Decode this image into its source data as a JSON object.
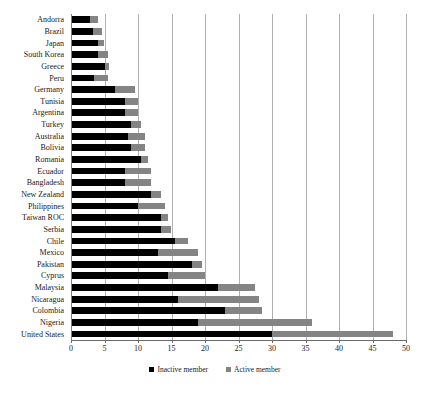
{
  "chart_data": {
    "type": "bar",
    "orientation": "horizontal",
    "stacked": true,
    "title": "",
    "subtitle": "",
    "xlabel": "",
    "ylabel": "",
    "xlim": [
      0,
      50
    ],
    "xticks": [
      0,
      5,
      10,
      15,
      20,
      25,
      30,
      35,
      40,
      45,
      50
    ],
    "xtick_labels": [
      "0",
      "5",
      "10",
      "15",
      "20",
      "25",
      "30",
      "35",
      "40",
      "45",
      "50"
    ],
    "grid": true,
    "grid_axis": "x",
    "legend_position": "bottom",
    "categories": [
      "Andorra",
      "Brazil",
      "Japan",
      "South Korea",
      "Greece",
      "Peru",
      "Germany",
      "Tunisia",
      "Argentina",
      "Turkey",
      "Australia",
      "Bolivia",
      "Romania",
      "Ecuador",
      "Bangladesh",
      "New Zealand",
      "Philippines",
      "Taiwan ROC",
      "Serbia",
      "Chile",
      "Mexico",
      "Pakistan",
      "Cyprus",
      "Malaysia",
      "Nicaragua",
      "Colombia",
      "Nigeria",
      "United States"
    ],
    "series": [
      {
        "name": "Inactive member",
        "color": "#000000",
        "values": [
          2.8,
          3.3,
          4.0,
          4.0,
          5.0,
          3.5,
          6.5,
          8.0,
          8.0,
          9.0,
          8.5,
          9.0,
          10.5,
          8.0,
          8.0,
          12.0,
          10.0,
          13.5,
          13.5,
          15.5,
          13.0,
          18.0,
          14.5,
          22.0,
          16.0,
          23.0,
          19.0,
          30.0
        ]
      },
      {
        "name": "Active member",
        "color": "#848484",
        "values": [
          1.2,
          1.3,
          1.0,
          1.5,
          0.7,
          2.0,
          3.0,
          2.0,
          2.0,
          1.5,
          2.5,
          2.0,
          1.0,
          4.0,
          4.0,
          1.5,
          4.0,
          1.0,
          1.5,
          2.0,
          6.0,
          1.5,
          5.5,
          5.5,
          12.0,
          5.5,
          17.0,
          18.0
        ]
      }
    ],
    "totals": [
      4.0,
      4.6,
      5.0,
      5.5,
      5.7,
      5.5,
      9.5,
      10.0,
      10.0,
      10.5,
      11.0,
      11.0,
      11.5,
      12.0,
      12.0,
      13.5,
      14.0,
      14.5,
      15.0,
      17.5,
      19.0,
      19.5,
      20.0,
      27.5,
      28.0,
      28.5,
      36.0,
      48.0
    ]
  },
  "legend": {
    "entries": [
      {
        "label": "Inactive member",
        "swatch": "legend-swatch-inactive"
      },
      {
        "label": "Active member",
        "swatch": "legend-swatch-active"
      }
    ]
  }
}
